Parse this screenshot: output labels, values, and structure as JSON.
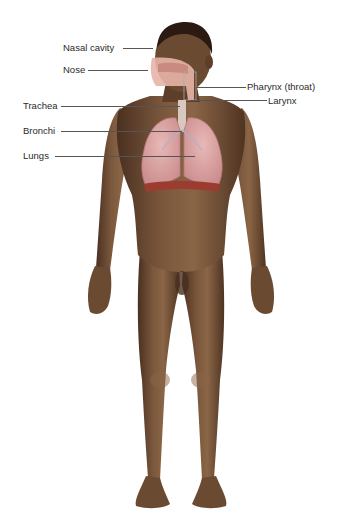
{
  "diagram": {
    "colors": {
      "background": "#ffffff",
      "skin": "#6b4a32",
      "skin_highlight": "#8a6546",
      "skin_shadow": "#4a3020",
      "hair": "#2a1a12",
      "lungs": "#d9a0a0",
      "lungs_edge": "#b87878",
      "diaphragm": "#9c3b30",
      "airway": "#e8b5a8",
      "trachea": "#d8c8c0",
      "leader_line": "#555555",
      "label_text": "#2b2b2b"
    },
    "labels": [
      {
        "id": "nasal-cavity",
        "text": "Nasal cavity",
        "side": "left"
      },
      {
        "id": "nose",
        "text": "Nose",
        "side": "left"
      },
      {
        "id": "pharynx",
        "text": "Pharynx (throat)",
        "side": "right"
      },
      {
        "id": "larynx",
        "text": "Larynx",
        "side": "right"
      },
      {
        "id": "trachea",
        "text": "Trachea",
        "side": "left"
      },
      {
        "id": "bronchi",
        "text": "Bronchi",
        "side": "left"
      },
      {
        "id": "lungs",
        "text": "Lungs",
        "side": "left"
      }
    ]
  }
}
